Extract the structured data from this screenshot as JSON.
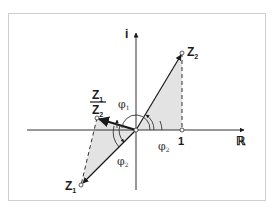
{
  "diagram": {
    "axes": {
      "real_label": "ℝ",
      "imag_label": "i",
      "unit_label": "1"
    },
    "points": {
      "z2_label_base": "Z",
      "z2_label_sub": "2",
      "z1_label_base": "Z",
      "z1_label_sub": "1",
      "quotient_numerator_base": "Z",
      "quotient_numerator_sub": "1",
      "quotient_denominator_base": "Z",
      "quotient_denominator_sub": "2"
    },
    "angles": {
      "phi1_base": "φ",
      "phi1_sub": "1",
      "phi2_right_base": "φ",
      "phi2_right_sub": "2",
      "phi2_left_base": "φ",
      "phi2_left_sub": "2"
    },
    "colors": {
      "frame": "#cfcfcf",
      "ink": "#1a1a1a",
      "shade": "#e3e3e3"
    }
  }
}
